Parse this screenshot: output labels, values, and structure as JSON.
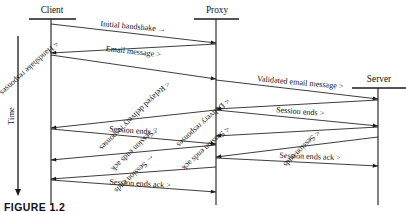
{
  "figure": {
    "caption": "FIGURE 1.2",
    "time_axis_label": "Time"
  },
  "actors": [
    {
      "id": "client",
      "label": "Client",
      "lifeline_x": 51,
      "bar_x1": 29,
      "bar_x2": 76,
      "bar_y": 19,
      "label_x": 52,
      "label_y": 13
    },
    {
      "id": "proxy",
      "label": "Proxy",
      "lifeline_x": 216,
      "bar_x1": 194,
      "bar_x2": 239,
      "bar_y": 19,
      "label_x": 217,
      "label_y": 13
    },
    {
      "id": "server",
      "label": "Server",
      "lifeline_x": 378,
      "bar_x1": 352,
      "bar_x2": 406,
      "bar_y": 88,
      "label_x": 379,
      "label_y": 82
    }
  ],
  "messages": [
    {
      "id": "m1",
      "label": "Initial handshake →",
      "from": "client",
      "to": "proxy",
      "y_start": 24,
      "y_end": 43,
      "label_x": 133,
      "label_y": 29,
      "anchor": "middle"
    },
    {
      "id": "m2",
      "label": "< Handshake responses",
      "from": "proxy",
      "to": "client",
      "y_start": 44,
      "y_end": 53,
      "label_x": 56,
      "label_y": 41,
      "anchor": "start"
    },
    {
      "id": "m3",
      "label": "Email message >",
      "from": "client",
      "to": "proxy",
      "y_start": 55,
      "y_end": 79,
      "label_x": 133,
      "label_y": 54,
      "anchor": "middle"
    },
    {
      "id": "m4",
      "label": "Validated email message >",
      "from": "proxy",
      "to": "server",
      "y_start": 80,
      "y_end": 99,
      "label_x": 300,
      "label_y": 85,
      "anchor": "middle"
    },
    {
      "id": "m5",
      "label": "< Delivery responses",
      "from": "server",
      "to": "proxy",
      "y_start": 100,
      "y_end": 109,
      "label_x": 227,
      "label_y": 98,
      "anchor": "start"
    },
    {
      "id": "m6",
      "label": "< Relayed delivery responses",
      "from": "proxy",
      "to": "client",
      "y_start": 110,
      "y_end": 128,
      "label_x": 133,
      "label_y": 114,
      "anchor": "middle"
    },
    {
      "id": "m7",
      "label": "Session ends >",
      "from": "proxy",
      "to": "server",
      "y_start": 110,
      "y_end": 126,
      "label_x": 300,
      "label_y": 114,
      "anchor": "middle"
    },
    {
      "id": "m8",
      "label": "Session ends >",
      "from": "client",
      "to": "proxy",
      "y_start": 129,
      "y_end": 144,
      "label_x": 133,
      "label_y": 133,
      "anchor": "middle"
    },
    {
      "id": "m9",
      "label": "< Session ends ack",
      "from": "server",
      "to": "proxy",
      "y_start": 127,
      "y_end": 136,
      "label_x": 227,
      "label_y": 126,
      "anchor": "start"
    },
    {
      "id": "m10",
      "label": "< Session ends ack",
      "from": "proxy",
      "to": "client",
      "y_start": 145,
      "y_end": 160,
      "label_x": 133,
      "label_y": 147,
      "anchor": "middle"
    },
    {
      "id": "m11",
      "label": "< Session ends",
      "from": "server",
      "to": "proxy",
      "y_start": 137,
      "y_end": 157,
      "label_x": 300,
      "label_y": 147,
      "anchor": "middle"
    },
    {
      "id": "m12",
      "label": "Session ends ack >",
      "from": "proxy",
      "to": "server",
      "y_start": 158,
      "y_end": 166,
      "label_x": 310,
      "label_y": 159,
      "anchor": "middle"
    },
    {
      "id": "m13",
      "label": "← Session ends",
      "from": "proxy",
      "to": "client",
      "y_start": 167,
      "y_end": 179,
      "label_x": 133,
      "label_y": 172,
      "anchor": "middle"
    },
    {
      "id": "m14",
      "label": "Session ends ack >",
      "from": "client",
      "to": "proxy",
      "y_start": 180,
      "y_end": 192,
      "label_x": 140,
      "label_y": 186,
      "anchor": "middle"
    }
  ],
  "time_axis": {
    "x": 18,
    "y_top": 36,
    "y_bottom": 196,
    "label_x": 14,
    "label_y": 116
  },
  "colors": {
    "line": "#1a1a1a",
    "text": "#111111",
    "background": "#ffffff"
  }
}
